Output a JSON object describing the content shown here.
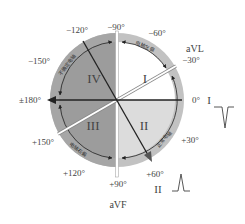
{
  "diagram": {
    "type": "hexaxial-ecg-axis",
    "center": [
      117,
      100
    ],
    "colors": {
      "outer_ring": "#b8b8b8",
      "left_half": "#9a9a9a",
      "quadrant_I": "#ffffff",
      "quadrant_II": "#d9d9d9",
      "axis_line": "#222222",
      "white_line": "#ffffff"
    },
    "angle_labels": {
      "m90": "−90°",
      "m60": "−60°",
      "m30": "−30°",
      "zero": "0°",
      "p30": "+30°",
      "p60": "+60°",
      "p90": "+90°",
      "p120": "+120°",
      "p150": "+150°",
      "p180": "±180°",
      "m150": "−150°",
      "m120": "−120°"
    },
    "quadrants": {
      "q1": "I",
      "q2": "II",
      "q3": "III",
      "q4": "IV"
    },
    "zones": {
      "left_axis": "电轴左偏",
      "normal_axis": "正常电轴",
      "right_axis": "电轴右偏",
      "indeterminate_axis": "不确定电轴"
    },
    "leads": {
      "avl": "aVL",
      "avf": "aVF",
      "lead_I": "I",
      "lead_II": "II"
    },
    "waveforms": {
      "lead_I": "negative-deflection",
      "lead_II": "positive-deflection"
    }
  }
}
